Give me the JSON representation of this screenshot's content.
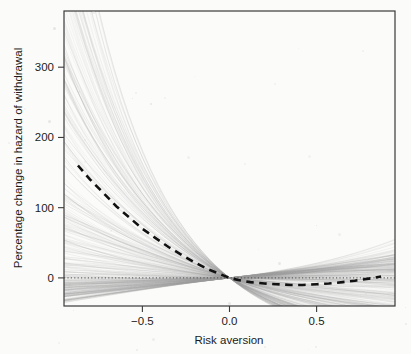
{
  "chart_data": {
    "type": "line",
    "title": "",
    "subtitle": "",
    "xlabel": "Risk aversion",
    "ylabel": "Percentage change in hazard of withdrawal",
    "xlim": [
      -0.95,
      0.95
    ],
    "ylim": [
      -40,
      380
    ],
    "xticks": [
      -0.5,
      0.0,
      0.5
    ],
    "xticklabels": [
      "−0.5",
      "0.0",
      "0.5"
    ],
    "yticks": [
      0,
      100,
      200,
      300
    ],
    "yticklabels": [
      "0",
      "100",
      "200",
      "300"
    ],
    "grid": false,
    "legend": "none",
    "annotations": [
      {
        "name": "zero-reference-line",
        "type": "hline",
        "y": 0,
        "style": "dotted"
      },
      {
        "name": "convergence-point",
        "x": 0.0,
        "y": 0
      }
    ],
    "series": [
      {
        "name": "Posterior median",
        "style": "dashed",
        "color": "#111111",
        "width": 2.6,
        "x": [
          -0.87,
          -0.8,
          -0.72,
          -0.65,
          -0.57,
          -0.5,
          -0.42,
          -0.35,
          -0.27,
          -0.2,
          -0.12,
          -0.05,
          0.0,
          0.05,
          0.12,
          0.2,
          0.27,
          0.35,
          0.42,
          0.5,
          0.57,
          0.65,
          0.72,
          0.8,
          0.87
        ],
        "y": [
          160,
          140,
          120,
          102,
          85,
          70,
          56,
          44,
          32,
          22,
          12,
          5,
          0,
          -3,
          -6,
          -8,
          -9,
          -10,
          -10,
          -9,
          -8,
          -6,
          -4,
          -1,
          2
        ]
      },
      {
        "name": "Posterior draws (n=300)",
        "style": "solid-translucent",
        "color": "#9a9a9a",
        "width": 0.5,
        "description": "Fan of 300 convex curves all passing through (0,0); upper envelope reaches beyond 380 at x=-0.87, lower envelope about -30 at x=-0.87; right side spreads from about -22 to 60 at x=0.87",
        "envelope_upper": {
          "x": [
            -0.87,
            -0.7,
            -0.5,
            -0.3,
            -0.15,
            0.0,
            0.2,
            0.4,
            0.6,
            0.87
          ],
          "y": [
            420,
            330,
            215,
            110,
            45,
            0,
            8,
            22,
            40,
            62
          ]
        },
        "envelope_lower": {
          "x": [
            -0.87,
            -0.7,
            -0.5,
            -0.3,
            -0.15,
            0.0,
            0.2,
            0.4,
            0.6,
            0.87
          ],
          "y": [
            -30,
            -24,
            -18,
            -11,
            -5,
            0,
            -6,
            -13,
            -19,
            -24
          ]
        }
      }
    ]
  },
  "axes": {
    "x_title": "Risk aversion",
    "y_title": "Percentage change in hazard of withdrawal",
    "x_tick_labels": [
      "−0.5",
      "0.0",
      "0.5"
    ],
    "y_tick_labels": [
      "300",
      "200",
      "100",
      "0"
    ]
  },
  "colors": {
    "background": "#fbfbfa",
    "frame": "#3a3a3a",
    "median_line": "#111111",
    "draws": "#8d8d8d",
    "zero_line": "#555555",
    "text": "#1b1b1b"
  }
}
